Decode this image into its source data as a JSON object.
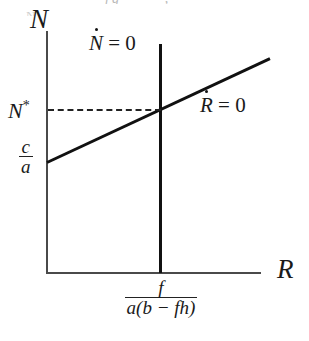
{
  "figure": {
    "kind": "phase-plane-nullcline-diagram",
    "background_color": "#ffffff",
    "line_color": "#111111",
    "axis_color": "#4a4a4a",
    "axes": {
      "vertical_label": "N",
      "horizontal_label": "R"
    },
    "labels": {
      "n_nullcline": {
        "variable": "N",
        "equals": " = 0"
      },
      "r_nullcline": {
        "variable": "R",
        "equals": " = 0"
      },
      "equilibrium_y": "N",
      "equilibrium_y_superscript": "*"
    },
    "intercepts": {
      "y_intercept": {
        "numerator": "c",
        "denominator": "a"
      },
      "x_intercept": {
        "numerator": "f",
        "denominator": "a(b − fh)"
      }
    },
    "artifact_text": {
      "clipped_line": "ƒg—— —, — —",
      "clipped_line_2": "N"
    }
  },
  "chart_data": {
    "type": "line",
    "title": "",
    "xlabel": "R",
    "ylabel": "N",
    "grid": false,
    "legend": "inline-annotations",
    "xlim": [
      0,
      1
    ],
    "ylim": [
      0,
      1
    ],
    "series": [
      {
        "name": "Ṅ = 0",
        "style": "solid-vertical",
        "points": [
          [
            0.53,
            0.0
          ],
          [
            0.53,
            1.0
          ]
        ],
        "annotation": "Ṅ = 0"
      },
      {
        "name": "Ṙ = 0",
        "style": "solid-increasing",
        "points": [
          [
            0.0,
            0.46
          ],
          [
            1.0,
            0.89
          ]
        ],
        "annotation": "Ṙ = 0"
      },
      {
        "name": "N* projector",
        "style": "dashed-horizontal",
        "points": [
          [
            0.0,
            0.68
          ],
          [
            0.53,
            0.68
          ]
        ],
        "annotation": "N*"
      }
    ],
    "annotations": [
      {
        "text": "N*",
        "axis": "y",
        "value": 0.68,
        "role": "equilibrium-tick"
      },
      {
        "text": "c/a",
        "axis": "y",
        "value": 0.46,
        "role": "y-intercept-tick"
      },
      {
        "text": "f/a(b − fh)",
        "axis": "x",
        "value": 0.53,
        "role": "x-intercept-tick"
      }
    ]
  }
}
